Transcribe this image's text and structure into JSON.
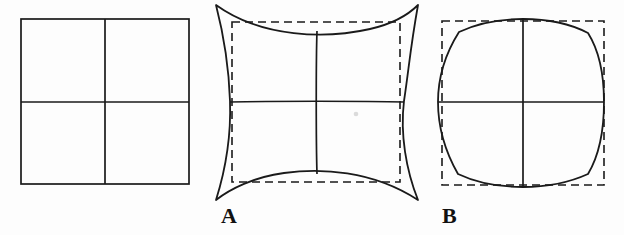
{
  "figure": {
    "kind": "lens-distortion-diagram",
    "background_color": "#fdfdfd",
    "stroke_color": "#1a1a1a",
    "canvas": {
      "width": 624,
      "height": 235
    }
  },
  "panels": [
    {
      "id": "reference",
      "label": "",
      "name": "undistorted-grid",
      "description": "Undistorted reference square with 2x2 grid",
      "box": {
        "x": 21,
        "y": 19,
        "width": 168,
        "height": 165
      },
      "has_dashed_reference": false,
      "distortion": "none",
      "bulge": 0
    },
    {
      "id": "A",
      "label": "A",
      "name": "pincushion-distortion",
      "description": "Pincushion distortion: edges bow inward, corners extend beyond the dashed reference square",
      "box": {
        "x": 232,
        "y": 22,
        "width": 168,
        "height": 160
      },
      "solid_extent": {
        "x": 216,
        "y": 5,
        "width": 202,
        "height": 195
      },
      "has_dashed_reference": true,
      "distortion": "pincushion",
      "bulge": -18
    },
    {
      "id": "B",
      "label": "B",
      "name": "barrel-distortion",
      "description": "Barrel distortion: edges bow outward, corners pull inside the dashed reference square",
      "box": {
        "x": 442,
        "y": 21,
        "width": 162,
        "height": 164
      },
      "has_dashed_reference": true,
      "distortion": "barrel",
      "bulge": 5
    }
  ],
  "labels": {
    "panel_a": "A",
    "panel_b": "B"
  },
  "style": {
    "solid_stroke_width": 1.6,
    "grid_stroke_width": 1.6,
    "dashed_stroke_width": 1.6,
    "dash_pattern": "8 5"
  }
}
